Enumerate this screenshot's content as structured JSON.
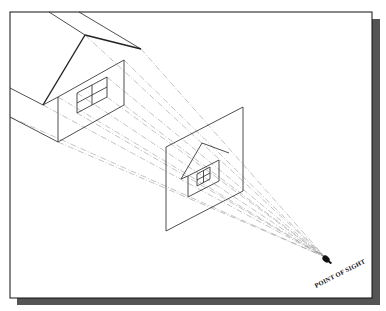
{
  "figure": {
    "type": "perspective-projection-diagram",
    "eye_label": "POINT OF SIGHT",
    "colors": {
      "frame": "#111111",
      "shadow": "#555555",
      "lines": "#333333",
      "projectors": "#9a9a9a",
      "background": "#ffffff"
    },
    "elements": [
      {
        "name": "object-house",
        "description": "3D house with gable roof and four-pane window"
      },
      {
        "name": "picture-plane",
        "description": "Transparent plane showing projected house image"
      },
      {
        "name": "projected-house",
        "description": "Smaller house image on picture plane"
      },
      {
        "name": "eye",
        "description": "Viewer eye at the point of sight"
      },
      {
        "name": "projectors",
        "description": "Dashed visual rays from house corners converging to eye"
      }
    ]
  }
}
